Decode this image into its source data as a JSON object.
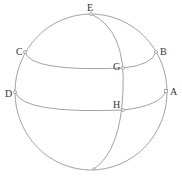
{
  "diagram": {
    "type": "sphere-with-great-and-small-circles",
    "points": [
      {
        "id": "E",
        "label": "E",
        "x": 91,
        "y": 14,
        "lx": 87,
        "ly": 11
      },
      {
        "id": "C",
        "label": "C",
        "x": 25,
        "y": 52,
        "lx": 16,
        "ly": 52
      },
      {
        "id": "B",
        "label": "B",
        "x": 156,
        "y": 52,
        "lx": 160,
        "ly": 52
      },
      {
        "id": "G",
        "label": "G",
        "x": 123,
        "y": 68,
        "lx": 113,
        "ly": 67
      },
      {
        "id": "D",
        "label": "D",
        "x": 15,
        "y": 92,
        "lx": 6,
        "ly": 97
      },
      {
        "id": "A",
        "label": "A",
        "x": 166,
        "y": 91,
        "lx": 170,
        "ly": 95
      },
      {
        "id": "H",
        "label": "H",
        "x": 123,
        "y": 110,
        "lx": 113,
        "ly": 108
      },
      {
        "id": "bottom",
        "label": "",
        "x": 94,
        "y": 169
      }
    ]
  }
}
